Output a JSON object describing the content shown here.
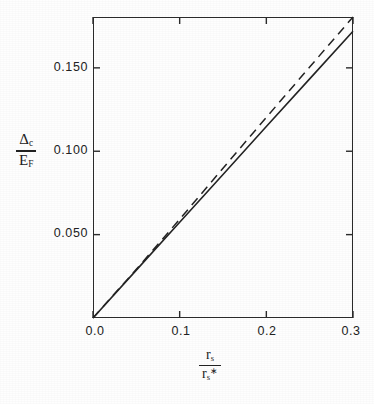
{
  "chart_data": {
    "type": "line",
    "title": "",
    "subtitle": "",
    "xlabel": "rs / rs*",
    "ylabel": "Δc / EF",
    "xlabel_parts": {
      "numerator": "r",
      "numerator_sub": "s",
      "denominator": "r",
      "denominator_sub": "s",
      "denominator_sup": "∗"
    },
    "ylabel_parts": {
      "numerator": "Δ",
      "numerator_sub": "c",
      "denominator": "E",
      "denominator_sub": "F"
    },
    "xlim": [
      0.0,
      0.3
    ],
    "ylim": [
      0.0,
      0.1805
    ],
    "xticks": [
      0.0,
      0.1,
      0.2,
      0.3
    ],
    "xtick_labels": [
      "0.0",
      "0.1",
      "0.2",
      "0.3"
    ],
    "yticks": [
      0.05,
      0.1,
      0.15
    ],
    "ytick_labels": [
      "0.050",
      "0.100",
      "0.150"
    ],
    "grid": false,
    "legend": "none",
    "tick_direction": "inward",
    "frame": "box",
    "series": [
      {
        "name": "solid",
        "style": "solid",
        "color": "#232323",
        "x": [
          0.0,
          0.05,
          0.1,
          0.15,
          0.2,
          0.25,
          0.3
        ],
        "values": [
          0.0,
          0.0287,
          0.0574,
          0.0861,
          0.1148,
          0.1434,
          0.172
        ]
      },
      {
        "name": "dashed",
        "style": "dashed",
        "color": "#232323",
        "x": [
          0.0,
          0.05,
          0.1,
          0.15,
          0.2,
          0.25,
          0.3
        ],
        "values": [
          0.0,
          0.0292,
          0.0592,
          0.0898,
          0.1203,
          0.1505,
          0.1805
        ]
      }
    ]
  },
  "axes": {
    "x_tick_labels": [
      "0.0",
      "0.1",
      "0.2",
      "0.3"
    ],
    "y_tick_labels": [
      "0.050",
      "0.100",
      "0.150"
    ]
  }
}
